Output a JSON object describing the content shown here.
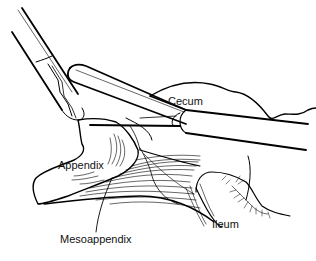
{
  "figure": {
    "type": "surgical illustration",
    "labels": {
      "cecum": "Cecum",
      "appendix": "Appendix",
      "mesoappendix": "Mesoappendix",
      "ileum": "Ileum"
    },
    "caption": "",
    "colors": {
      "line": "#000000",
      "background": "#ffffff"
    }
  }
}
